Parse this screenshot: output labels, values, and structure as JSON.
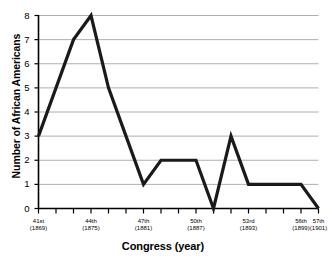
{
  "chart_data": {
    "type": "line",
    "title": "",
    "subtitle": "",
    "xlabel": "Congress (year)",
    "ylabel": "Number of African Americans",
    "ylim": [
      0,
      8
    ],
    "yticks": [
      0,
      1,
      2,
      3,
      4,
      5,
      6,
      7,
      8
    ],
    "grid": true,
    "legend": false,
    "legend_position": "none",
    "categories": [
      "41st",
      "42nd",
      "43rd",
      "44th",
      "45th",
      "46th",
      "47th",
      "48th",
      "49th",
      "50th",
      "51st",
      "52nd",
      "53rd",
      "54th",
      "55th",
      "56th",
      "57th"
    ],
    "x_tick_labels": [
      {
        "congress": "41st",
        "year": "(1869)",
        "show": true
      },
      {
        "congress": "42nd",
        "year": "(1871)",
        "show": false
      },
      {
        "congress": "43rd",
        "year": "(1873)",
        "show": false
      },
      {
        "congress": "44th",
        "year": "(1875)",
        "show": true
      },
      {
        "congress": "45th",
        "year": "(1877)",
        "show": false
      },
      {
        "congress": "46th",
        "year": "(1879)",
        "show": false
      },
      {
        "congress": "47th",
        "year": "(1881)",
        "show": true
      },
      {
        "congress": "48th",
        "year": "(1883)",
        "show": false
      },
      {
        "congress": "49th",
        "year": "(1885)",
        "show": false
      },
      {
        "congress": "50th",
        "year": "(1887)",
        "show": true
      },
      {
        "congress": "51st",
        "year": "(1889)",
        "show": false
      },
      {
        "congress": "52nd",
        "year": "(1891)",
        "show": false
      },
      {
        "congress": "53rd",
        "year": "(1893)",
        "show": true
      },
      {
        "congress": "54th",
        "year": "(1895)",
        "show": false
      },
      {
        "congress": "55th",
        "year": "(1897)",
        "show": false
      },
      {
        "congress": "56th",
        "year": "(1899)",
        "show": true
      },
      {
        "congress": "57th",
        "year": "(1901)",
        "show": true
      }
    ],
    "series": [
      {
        "name": "Number of African Americans",
        "values": [
          3,
          5,
          7,
          8,
          5,
          3,
          1,
          2,
          2,
          2,
          0,
          3,
          1,
          1,
          1,
          1,
          0
        ],
        "color": "#1a1a1a"
      }
    ],
    "colors": {
      "line": "#1a1a1a",
      "axis": "#000000",
      "grid": "#9a9a9a",
      "background": "#ffffff",
      "text": "#000000"
    }
  }
}
